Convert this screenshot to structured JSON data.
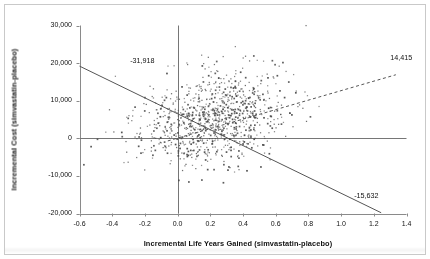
{
  "chart_data": {
    "type": "scatter",
    "title": "",
    "xlabel": "Incremental Life Years Gained (simvastatin-placebo)",
    "ylabel": "Incremental Cost (simvastatin-placebo)",
    "xlim": [
      -0.6,
      1.4
    ],
    "ylim": [
      -20000,
      30000
    ],
    "xticks": [
      "-0.6",
      "-0.4",
      "-0.2",
      "0.0",
      "0.2",
      "0.4",
      "0.6",
      "0.8",
      "1.0",
      "1.2",
      "1.4"
    ],
    "xtick_values": [
      -0.6,
      -0.4,
      -0.2,
      0.0,
      0.2,
      0.4,
      0.6,
      0.8,
      1.0,
      1.2,
      1.4
    ],
    "yticks": [
      "30,000",
      "20,000",
      "10,000",
      "0",
      "-10,000",
      "-20,000"
    ],
    "ytick_values": [
      30000,
      20000,
      10000,
      0,
      -10000,
      -20000
    ],
    "grid": false,
    "legend": "none",
    "zero_lines": {
      "horizontal_y": 0,
      "vertical_x": 0.0
    },
    "annotations": [
      {
        "label": "-31,918",
        "x": -0.29,
        "y": 20600,
        "name": "upper-threshold-label"
      },
      {
        "label": "14,415",
        "x": 1.3,
        "y": 21500,
        "name": "regression-endpoint-label"
      },
      {
        "label": "-15,632",
        "x": 1.08,
        "y": -15200,
        "name": "lower-threshold-label"
      }
    ],
    "reference_lines": [
      {
        "name": "threshold-line-upper",
        "style": "solid",
        "color": "#555555",
        "x1": -0.6,
        "y1": 19200,
        "x2": 1.245,
        "y2": -19800
      },
      {
        "name": "regression-line",
        "style": "dashed",
        "color": "#555555",
        "x1": -0.06,
        "y1": -700,
        "x2": 1.335,
        "y2": 16900
      }
    ],
    "series": [
      {
        "name": "bootstrap-replicates",
        "marker": "dot",
        "color": "#4a4a4a",
        "n_points": 1000,
        "cluster": {
          "x_mean": 0.22,
          "x_sd": 0.22,
          "y_mean": 5200,
          "y_sd": 6200,
          "correlation": 0.3
        },
        "description": "Cost-effectiveness plane bootstrap scatter, simvastatin vs placebo"
      }
    ]
  },
  "figure": {
    "x_axis_title": "Incremental Life Years Gained (simvastatin-placebo)",
    "y_axis_title": "Incremental Cost (simvastatin-placebo)"
  }
}
